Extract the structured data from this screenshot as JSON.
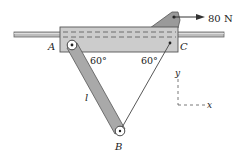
{
  "diagram": {
    "force_label": "80 N",
    "point_a": "A",
    "point_b": "B",
    "point_c": "C",
    "angle_left": "60°",
    "angle_right": "60°",
    "length_label": "l",
    "axis_y": "y",
    "axis_x": "x"
  },
  "colors": {
    "block_fill": "#c8c8c8",
    "block_stroke": "#555555",
    "link_fill": "#a8a8a8",
    "rod_fill": "#b8b8b8",
    "line": "#444444"
  }
}
